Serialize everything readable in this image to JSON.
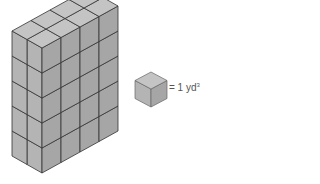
{
  "figure": {
    "dimensions": {
      "width_cubes": 2,
      "depth_cubes": 4,
      "height_cubes": 5
    },
    "colors": {
      "front_face": "#b4b4b4",
      "side_face": "#a6a6a6",
      "top_face": "#c4c4c4",
      "edge": "#333333"
    }
  },
  "legend": {
    "equals": "= 1 yd",
    "exponent": "3"
  }
}
